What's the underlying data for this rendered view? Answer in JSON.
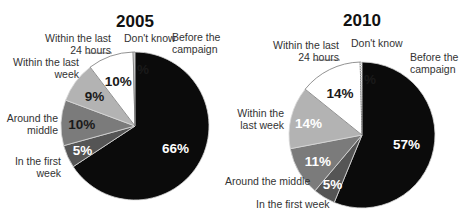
{
  "chart_data": [
    {
      "type": "pie",
      "title": "2005",
      "start": "12 o'clock",
      "direction": "clockwise",
      "slices": [
        {
          "label": "Before the campaign",
          "value": 66,
          "display": "66%",
          "color": "#0b0b0b",
          "text_color": "#ffffff"
        },
        {
          "label": "In the first week",
          "value": 5,
          "display": "5%",
          "color": "#555555",
          "text_color": "#ffffff"
        },
        {
          "label": "Around the middle",
          "value": 10,
          "display": "10%",
          "color": "#7b7b7b",
          "text_color": "#1a1a1a"
        },
        {
          "label": "Within the last week",
          "value": 9,
          "display": "9%",
          "color": "#b3b3b3",
          "text_color": "#1a1a1a"
        },
        {
          "label": "Within the last 24 hours",
          "value": 10,
          "display": "10%",
          "color": "#ffffff",
          "text_color": "#1a1a1a"
        },
        {
          "label": "Don't know",
          "value": 0.4,
          "display": "%",
          "color": "#ffffff",
          "text_color": "#1a1a1a"
        }
      ],
      "outer_labels": [
        [
          "Before the",
          "campaign"
        ],
        [
          "In the first",
          "week"
        ],
        [
          "Around the",
          "middle"
        ],
        [
          "Within the last",
          "week"
        ],
        [
          "Within the last",
          "24 hours"
        ],
        [
          "Don't know"
        ]
      ]
    },
    {
      "type": "pie",
      "title": "2010",
      "start": "12 o'clock",
      "direction": "clockwise",
      "slices": [
        {
          "label": "Before the campaign",
          "value": 57,
          "display": "57%",
          "color": "#0b0b0b",
          "text_color": "#ffffff"
        },
        {
          "label": "In the first week",
          "value": 5,
          "display": "5%",
          "color": "#555555",
          "text_color": "#ffffff"
        },
        {
          "label": "Around the middle",
          "value": 11,
          "display": "11%",
          "color": "#7b7b7b",
          "text_color": "#ffffff"
        },
        {
          "label": "Within the last week",
          "value": 14,
          "display": "14%",
          "color": "#b3b3b3",
          "text_color": "#ffffff"
        },
        {
          "label": "Within the last 24 hours",
          "value": 14,
          "display": "14%",
          "color": "#ffffff",
          "text_color": "#1a1a1a"
        },
        {
          "label": "Don't know",
          "value": 0.4,
          "display": "%",
          "color": "#ffffff",
          "text_color": "#1a1a1a"
        }
      ],
      "outer_labels": [
        [
          "Before the",
          "campaign"
        ],
        [
          "In the first week"
        ],
        [
          "Around the middle"
        ],
        [
          "Within the",
          "last week"
        ],
        [
          "Within the last",
          "24 hours"
        ],
        [
          "Don't know"
        ]
      ]
    }
  ]
}
